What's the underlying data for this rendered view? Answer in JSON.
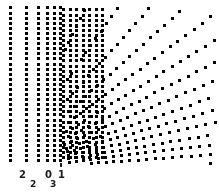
{
  "figure": {
    "name": "radial-dotted-ray-fan-plot",
    "background_color": "#ffffff",
    "dot_color": "#303030",
    "dot_color_light": "#8a8a8a",
    "width": 219,
    "height": 195
  },
  "axis": {
    "labels_upper": [
      {
        "text": "2",
        "x": 19,
        "y": 170
      },
      {
        "text": "0",
        "x": 45,
        "y": 170
      },
      {
        "text": "1",
        "x": 58,
        "y": 170
      }
    ],
    "labels_lower": [
      {
        "text": "2",
        "x": 30,
        "y": 180
      },
      {
        "text": "3",
        "x": 50,
        "y": 180
      }
    ],
    "tick_mark": {
      "x": 60,
      "y": 163,
      "width": 2,
      "height": 4
    }
  },
  "chart_data": {
    "type": "scatter",
    "title": "",
    "subtitle": "",
    "xlabel": "",
    "ylabel": "",
    "grid": false,
    "legend": null,
    "xlim": [
      0,
      219
    ],
    "ylim": [
      0,
      195
    ],
    "focus_point": {
      "x": 4,
      "y": 170
    },
    "plot_area": {
      "x0": 6,
      "y0": 6,
      "x1": 216,
      "y1": 164
    },
    "dot_size": 1.6,
    "dot_spacing_px": 5.1,
    "vertical_columns": {
      "x_positions": [
        11,
        27,
        39,
        48,
        55,
        61
      ],
      "y_start": 8,
      "y_end": 162,
      "y_step": 5.1
    },
    "rays": [
      {
        "index": 0,
        "angle_deg": -72.0,
        "dot_count": 31
      },
      {
        "index": 1,
        "angle_deg": -63.0,
        "dot_count": 31
      },
      {
        "index": 2,
        "angle_deg": -55.0,
        "dot_count": 31
      },
      {
        "index": 3,
        "angle_deg": -48.0,
        "dot_count": 32
      },
      {
        "index": 4,
        "angle_deg": -42.0,
        "dot_count": 33
      },
      {
        "index": 5,
        "angle_deg": -36.5,
        "dot_count": 34
      },
      {
        "index": 6,
        "angle_deg": -31.5,
        "dot_count": 35
      },
      {
        "index": 7,
        "angle_deg": -27.0,
        "dot_count": 36
      },
      {
        "index": 8,
        "angle_deg": -23.0,
        "dot_count": 37
      },
      {
        "index": 9,
        "angle_deg": -19.2,
        "dot_count": 38
      },
      {
        "index": 10,
        "angle_deg": -15.8,
        "dot_count": 39
      },
      {
        "index": 11,
        "angle_deg": -12.6,
        "dot_count": 40
      },
      {
        "index": 12,
        "angle_deg": -9.6,
        "dot_count": 41
      },
      {
        "index": 13,
        "angle_deg": -6.8,
        "dot_count": 42
      },
      {
        "index": 14,
        "angle_deg": -4.2,
        "dot_count": 42
      },
      {
        "index": 15,
        "angle_deg": -1.7,
        "dot_count": 42
      },
      {
        "index": 16,
        "angle_deg": 0.7,
        "dot_count": 42
      },
      {
        "index": 17,
        "angle_deg": 3.1,
        "dot_count": 42
      },
      {
        "index": 18,
        "angle_deg": 5.5,
        "dot_count": 42
      },
      {
        "index": 19,
        "angle_deg": 7.9,
        "dot_count": 42
      },
      {
        "index": 20,
        "angle_deg": 10.3,
        "dot_count": 41
      },
      {
        "index": 21,
        "angle_deg": 12.8,
        "dot_count": 40
      },
      {
        "index": 22,
        "angle_deg": 15.4,
        "dot_count": 39
      },
      {
        "index": 23,
        "angle_deg": 18.1,
        "dot_count": 38
      }
    ]
  }
}
